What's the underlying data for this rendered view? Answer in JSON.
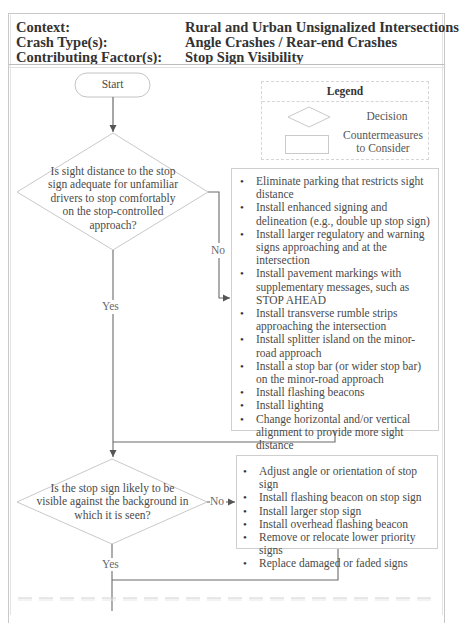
{
  "header": {
    "rows": [
      {
        "label": "Context:",
        "value": "Rural and Urban Unsignalized Intersections"
      },
      {
        "label": "Crash Type(s):",
        "value": "Angle Crashes / Rear-end Crashes"
      },
      {
        "label": "Contributing Factor(s):",
        "value": "Stop Sign Visibility"
      }
    ]
  },
  "flowchart": {
    "start_label": "Start",
    "legend": {
      "title": "Legend",
      "decision_label": "Decision",
      "countermeasures_label_line1": "Countermeasures",
      "countermeasures_label_line2": "to Consider"
    },
    "decisions": [
      {
        "lines": [
          "Is sight distance to the stop",
          "sign adequate for unfamiliar",
          "drivers to stop comfortably",
          "on the stop-controlled",
          "approach?"
        ],
        "no_label": "No",
        "yes_label": "Yes"
      },
      {
        "lines": [
          "Is the stop sign likely to be",
          "visible against the background in",
          "which it is seen?"
        ],
        "no_label": "No",
        "yes_label": "Yes"
      }
    ],
    "countermeasures": [
      {
        "items": [
          "Eliminate parking that restricts sight distance",
          "Install enhanced signing and delineation (e.g., double up stop sign)",
          "Install larger regulatory and warning signs approaching and at the intersection",
          "Install pavement markings with supplementary messages, such as STOP AHEAD",
          "Install transverse rumble strips approaching the intersection",
          "Install splitter island on the minor-road approach",
          "Install a stop bar (or wider stop bar) on the minor-road approach",
          "Install flashing beacons",
          "Install lighting",
          "Change horizontal and/or vertical alignment to provide more sight distance"
        ]
      },
      {
        "items": [
          "Adjust angle or orientation of stop sign",
          "Install flashing beacon on stop sign",
          "Install larger stop sign",
          "Install overhead flashing beacon",
          "Remove or relocate lower priority signs",
          "Replace damaged or faded signs"
        ]
      }
    ]
  },
  "colors": {
    "line": "#6b6b6b",
    "shape_border": "#c4c4c4",
    "text": "#4a4a4a"
  }
}
